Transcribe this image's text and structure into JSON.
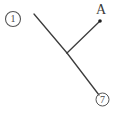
{
  "figure": {
    "background_color": "#ffffff",
    "stroke_color": "#3c3c3c",
    "width": 116,
    "height": 113,
    "item_number_label": "1",
    "vertex_label": "A",
    "footer_mark_label": "7",
    "point_marker_name": "point-a-dot",
    "segments": [
      {
        "name": "segment-upper-left",
        "x1": 34,
        "y1": 14,
        "x2": 67,
        "y2": 53
      },
      {
        "name": "segment-to-point-a",
        "x1": 67,
        "y1": 53,
        "x2": 100,
        "y2": 21
      },
      {
        "name": "segment-lower-right",
        "x1": 67,
        "y1": 53,
        "x2": 99,
        "y2": 95
      }
    ],
    "point_marker": {
      "cx": 100,
      "cy": 21,
      "r": 1.8
    },
    "circled_one": {
      "cx": 13,
      "cy": 19,
      "r": 7.5
    },
    "circled_seven": {
      "cx": 102.5,
      "cy": 99.5,
      "r": 6.5
    }
  }
}
